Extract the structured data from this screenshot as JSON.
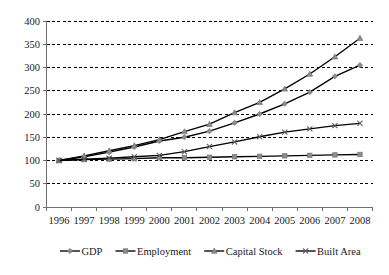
{
  "chart_data": {
    "type": "line",
    "title": "",
    "subtitle": "",
    "xlabel": "",
    "ylabel": "",
    "categories": [
      "1996",
      "1997",
      "1998",
      "1999",
      "2000",
      "2001",
      "2002",
      "2003",
      "2004",
      "2005",
      "2006",
      "2007",
      "2008"
    ],
    "ylim": [
      0,
      400
    ],
    "yticks": [
      0,
      50,
      100,
      150,
      200,
      250,
      300,
      350,
      400
    ],
    "ytick_labels": [
      "0",
      "50",
      "100",
      "150",
      "200",
      "250",
      "300",
      "350",
      "400"
    ],
    "grid": true,
    "grid_style": "dashed-horizontal",
    "legend_position": "bottom",
    "series": [
      {
        "name": "GDP",
        "marker": "diamond",
        "values": [
          100,
          108,
          118,
          129,
          142,
          150,
          163,
          181,
          200,
          222,
          247,
          281,
          305
        ]
      },
      {
        "name": "Employment",
        "marker": "square",
        "values": [
          100,
          102,
          103,
          104,
          106,
          106,
          107,
          108,
          109,
          110,
          111,
          112,
          113
        ]
      },
      {
        "name": "Capital Stock",
        "marker": "triangle",
        "values": [
          100,
          110,
          121,
          132,
          145,
          162,
          178,
          203,
          225,
          254,
          286,
          323,
          363
        ]
      },
      {
        "name": "Built Area",
        "marker": "x",
        "values": [
          100,
          103,
          105,
          108,
          111,
          119,
          130,
          140,
          151,
          161,
          168,
          175,
          180
        ]
      }
    ]
  },
  "legend": {
    "items": [
      {
        "label": "GDP"
      },
      {
        "label": "Employment"
      },
      {
        "label": "Capital Stock"
      },
      {
        "label": "Built Area"
      }
    ]
  },
  "colors": {
    "line": "#000000",
    "marker_fill": "#8c8c8c",
    "marker_stroke": "#7a7a7a",
    "grid": "#000000",
    "axis": "#6e6e6e",
    "text": "#1a1a1a",
    "background": "#ffffff"
  }
}
